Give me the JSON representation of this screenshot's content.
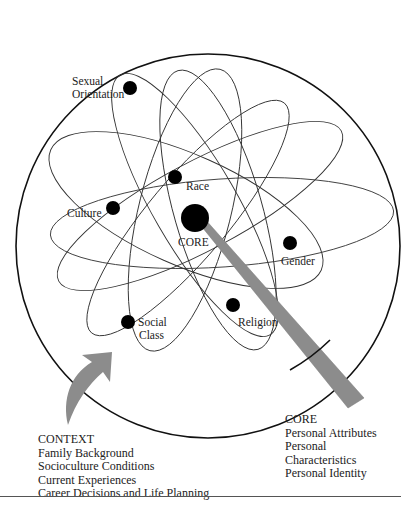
{
  "diagram": {
    "core_label": "CORE",
    "factors": [
      {
        "label_lines": [
          "Sexual",
          "Orientation"
        ]
      },
      {
        "label_lines": [
          "Race"
        ]
      },
      {
        "label_lines": [
          "Culture"
        ]
      },
      {
        "label_lines": [
          "Gender"
        ]
      },
      {
        "label_lines": [
          "Religion"
        ]
      },
      {
        "label_lines": [
          "Social",
          "Class"
        ]
      }
    ],
    "context_box": {
      "title": "CONTEXT",
      "items": [
        "Family Background",
        "Socioculture Conditions",
        "Current Experiences",
        "Career Decisions and Life Planning"
      ]
    },
    "core_box": {
      "title": "CORE",
      "items": [
        "Personal Attributes",
        "Personal",
        "Characteristics",
        "Personal Identity"
      ]
    },
    "colors": {
      "line": "#333333",
      "dot": "#000000",
      "arrow_fill": "#8c8c8c",
      "outer_circle": "#111111"
    }
  }
}
